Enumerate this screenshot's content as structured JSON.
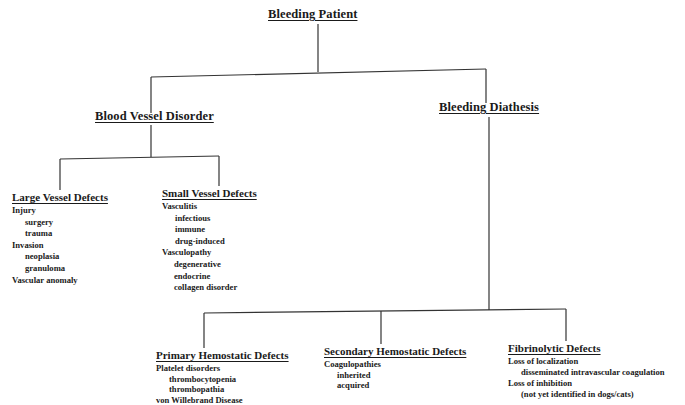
{
  "root": {
    "label": "Bleeding Patient"
  },
  "level1": [
    {
      "label": "Blood Vessel Disorder"
    },
    {
      "label": "Bleeding Diathesis"
    }
  ],
  "vessel_children": [
    {
      "label": "Large Vessel Defects",
      "items": [
        {
          "text": "Injury",
          "level": 0
        },
        {
          "text": "surgery",
          "level": 1
        },
        {
          "text": "trauma",
          "level": 1
        },
        {
          "text": "Invasion",
          "level": 0
        },
        {
          "text": "neoplasia",
          "level": 1
        },
        {
          "text": "granuloma",
          "level": 1
        },
        {
          "text": "Vascular anomaly",
          "level": 0
        }
      ]
    },
    {
      "label": "Small Vessel Defects",
      "items": [
        {
          "text": "Vasculitis",
          "level": 0
        },
        {
          "text": "infectious",
          "level": 1
        },
        {
          "text": "immune",
          "level": 1
        },
        {
          "text": "drug-induced",
          "level": 1
        },
        {
          "text": "Vasculopathy",
          "level": 0
        },
        {
          "text": "degenerative",
          "level": 1
        },
        {
          "text": "endocrine",
          "level": 1
        },
        {
          "text": "collagen disorder",
          "level": 1
        }
      ]
    }
  ],
  "diathesis_children": [
    {
      "label": "Primary Hemostatic Defects",
      "items": [
        {
          "text": "Platelet disorders",
          "level": 0
        },
        {
          "text": "thrombocytopenia",
          "level": 1
        },
        {
          "text": "thrombopathia",
          "level": 1
        },
        {
          "text": "von Willebrand Disease",
          "level": 0
        }
      ]
    },
    {
      "label": "Secondary Hemostatic Defects",
      "items": [
        {
          "text": "Coagulopathies",
          "level": 0
        },
        {
          "text": "inherited",
          "level": 1
        },
        {
          "text": "acquired",
          "level": 1
        }
      ]
    },
    {
      "label": "Fibrinolytic Defects",
      "items": [
        {
          "text": "Loss of localization",
          "level": 0
        },
        {
          "text": "disseminated intravascular coagulation",
          "level": 1
        },
        {
          "text": "Loss of inhibition",
          "level": 0
        },
        {
          "text": "(not yet identified in dogs/cats)",
          "level": 1
        }
      ]
    }
  ]
}
